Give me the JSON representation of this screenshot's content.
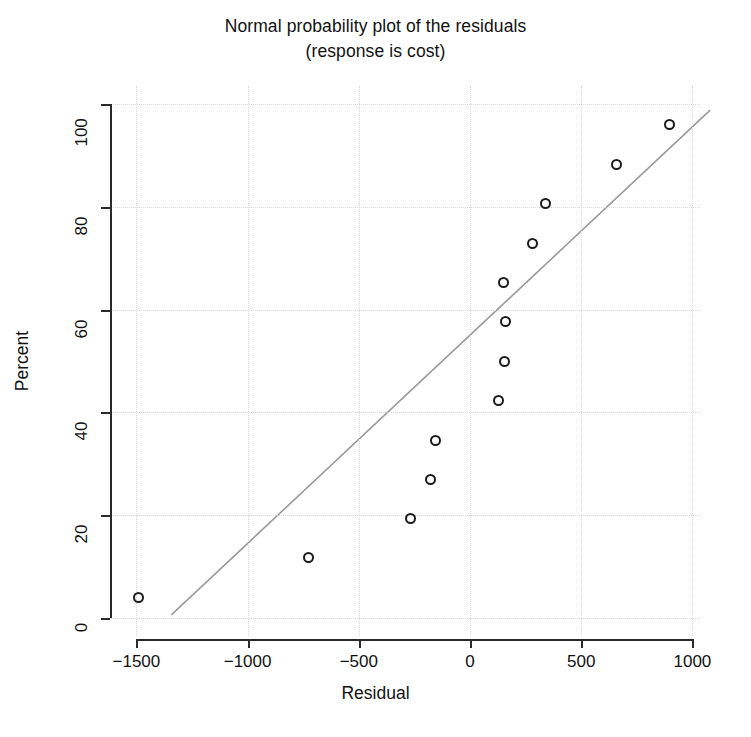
{
  "chart_data": {
    "type": "scatter",
    "title": "Normal probability plot of the residuals",
    "subtitle": "(response is cost)",
    "xlabel": "Residual",
    "ylabel": "Percent",
    "xlim": [
      -1500,
      1000
    ],
    "ylim": [
      0,
      100
    ],
    "xticks": [
      "-1500",
      "-1000",
      "-500",
      "0",
      "500",
      "1000"
    ],
    "xtick_values": [
      -1500,
      -1000,
      -500,
      0,
      500,
      1000
    ],
    "yticks": [
      "0",
      "20",
      "40",
      "60",
      "80",
      "100"
    ],
    "ytick_values": [
      0,
      20,
      40,
      60,
      80,
      100
    ],
    "grid": true,
    "grid_style": "dotted",
    "grid_color": "#d8d8d8",
    "marker": "open-circle",
    "marker_color": "#1b1b1b",
    "legend": "none",
    "points": [
      {
        "x": -1490,
        "y": 3.9
      },
      {
        "x": -728,
        "y": 11.7
      },
      {
        "x": -268,
        "y": 19.3
      },
      {
        "x": -178,
        "y": 26.9
      },
      {
        "x": -155,
        "y": 34.5
      },
      {
        "x": 128,
        "y": 42.3
      },
      {
        "x": 155,
        "y": 50.0
      },
      {
        "x": 158,
        "y": 57.6
      },
      {
        "x": 152,
        "y": 65.2
      },
      {
        "x": 280,
        "y": 72.9
      },
      {
        "x": 338,
        "y": 80.6
      },
      {
        "x": 660,
        "y": 88.2
      },
      {
        "x": 895,
        "y": 96.0
      }
    ],
    "reference_line": {
      "label": "normal reference line",
      "color": "#9a9a9a",
      "x_start": -1343,
      "y_start": 0.6,
      "x_end": 1080,
      "y_end": 98.8
    }
  }
}
